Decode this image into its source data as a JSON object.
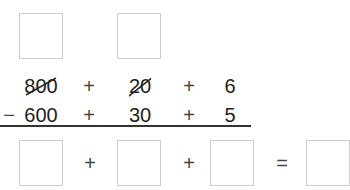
{
  "top_boxes": [
    {
      "value": ""
    },
    {
      "value": ""
    }
  ],
  "row1": {
    "terms": [
      "800",
      "+",
      "20",
      "+",
      "6"
    ],
    "struck": [
      true,
      false,
      true,
      false,
      false
    ]
  },
  "row2": {
    "sign": "−",
    "terms": [
      "600",
      "+",
      "30",
      "+",
      "5"
    ]
  },
  "answer_row": {
    "boxes": [
      {
        "value": ""
      },
      {
        "value": ""
      },
      {
        "value": ""
      },
      {
        "value": ""
      }
    ],
    "operators": [
      "+",
      "+",
      "="
    ]
  }
}
